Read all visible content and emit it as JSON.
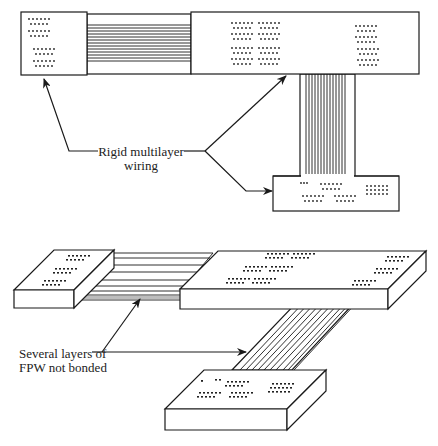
{
  "figure": {
    "top_panel": {
      "title": "Rigid multilayer wiring (planar view)",
      "label_lines": [
        "Rigid multilayer",
        "wiring"
      ],
      "arrow_count": 3
    },
    "bottom_panel": {
      "title": "Flexible printed wiring (perspective view)",
      "label_lines": [
        "Several layers of",
        "FPW not bonded"
      ],
      "arrow_count": 2
    }
  },
  "colors": {
    "ink": "#1a1a1a",
    "background": "#ffffff",
    "layer_shade": "#bdbdbd"
  }
}
